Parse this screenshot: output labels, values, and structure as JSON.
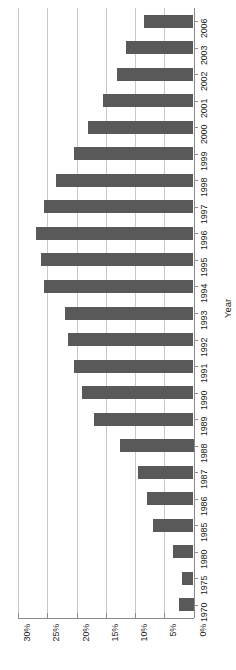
{
  "chart_data": {
    "type": "bar",
    "orientation": "horizontal-rotated",
    "title": "",
    "subtitle": "",
    "xlabel": "Year",
    "ylabel": "",
    "categories": [
      "2006",
      "2003",
      "2002",
      "2001",
      "2000",
      "1999",
      "1998",
      "1997",
      "1996",
      "1995",
      "1994",
      "1993",
      "1992",
      "1991",
      "1990",
      "1989",
      "1988",
      "1987",
      "1986",
      "1985",
      "1980",
      "1975",
      "1970"
    ],
    "values": [
      8.5,
      11.5,
      13.0,
      15.5,
      18.0,
      20.5,
      23.5,
      25.5,
      27.0,
      26.0,
      25.5,
      22.0,
      21.5,
      20.5,
      19.0,
      17.0,
      12.5,
      9.5,
      8.0,
      7.0,
      3.5,
      2.0,
      2.5
    ],
    "value_tick_labels": [
      "30%",
      "25%",
      "20%",
      "15%",
      "10%",
      "5%",
      "0%"
    ],
    "value_ticks": [
      30,
      25,
      20,
      15,
      10,
      5,
      0
    ],
    "xlim": [
      0,
      30
    ],
    "grid": true,
    "legend": "none",
    "unit": "percent",
    "bar_color": "#595959",
    "gridline_color": "#c8c8c8",
    "axis_color": "#8a8a8a",
    "background_color": "#ffffff",
    "annotations": []
  },
  "axis": {
    "category_title": "Year"
  }
}
